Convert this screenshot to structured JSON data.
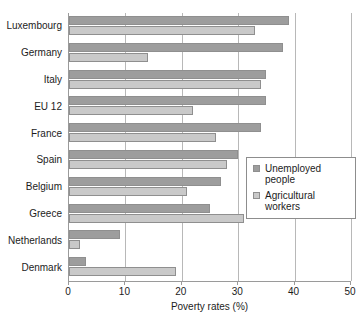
{
  "chart_data": {
    "type": "bar",
    "orientation": "horizontal",
    "title": "",
    "xlabel": "Poverty rates (%)",
    "ylabel": "",
    "xlim": [
      0,
      50
    ],
    "xticks": [
      0,
      10,
      20,
      30,
      40,
      50
    ],
    "xticklabels": [
      "0",
      "10",
      "20",
      "30",
      "40",
      "50"
    ],
    "grid": true,
    "legend_position": "center-right",
    "categories": [
      "Luxembourg",
      "Germany",
      "Italy",
      "EU 12",
      "France",
      "Spain",
      "Belgium",
      "Greece",
      "Netherlands",
      "Denmark"
    ],
    "series": [
      {
        "name": "Unemployed people",
        "color": "#9d9d9d",
        "values": [
          39,
          38,
          35,
          35,
          34,
          30,
          27,
          25,
          9,
          3
        ]
      },
      {
        "name": "Agricultural workers",
        "color": "#c9c9c9",
        "values": [
          33,
          14,
          34,
          22,
          26,
          28,
          21,
          31,
          2,
          19
        ]
      }
    ]
  },
  "legend": {
    "items": [
      {
        "label": "Unemployed people",
        "color": "#9d9d9d"
      },
      {
        "label": "Agricultural workers",
        "color": "#c9c9c9"
      }
    ]
  },
  "colors": {
    "background": "#ffffff",
    "axis": "#9a9a9a",
    "grid": "#b8b8b8",
    "text": "#1c1c1c",
    "series_unemployed": "#9d9d9d",
    "series_agricultural": "#c9c9c9"
  }
}
